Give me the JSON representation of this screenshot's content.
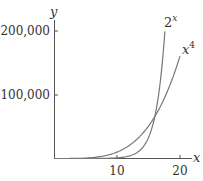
{
  "chart_data": {
    "type": "line",
    "title": "",
    "xlabel": "x",
    "ylabel": "y",
    "xlim": [
      0,
      21
    ],
    "ylim": [
      0,
      200000
    ],
    "x_ticks": [
      10,
      20
    ],
    "y_ticks": [
      100000,
      200000
    ],
    "x_tick_labels": [
      "10",
      "20"
    ],
    "y_tick_labels": [
      "100,000",
      "200,000"
    ],
    "grid": false,
    "legend": "inline labels at curve ends",
    "series": [
      {
        "name": "2^x",
        "label_base": "2",
        "label_exp": "x",
        "x": [
          0,
          2,
          4,
          6,
          8,
          10,
          12,
          14,
          15,
          16,
          17,
          17.6
        ],
        "y": [
          1,
          4,
          16,
          64,
          256,
          1024,
          4096,
          16384,
          32768,
          65536,
          131072,
          198600
        ]
      },
      {
        "name": "x^4",
        "label_base": "x",
        "label_exp": "4",
        "x": [
          0,
          2,
          4,
          6,
          8,
          10,
          12,
          14,
          16,
          18,
          20
        ],
        "y": [
          0,
          16,
          256,
          1296,
          4096,
          10000,
          20736,
          38416,
          65536,
          104976,
          160000
        ]
      }
    ]
  }
}
